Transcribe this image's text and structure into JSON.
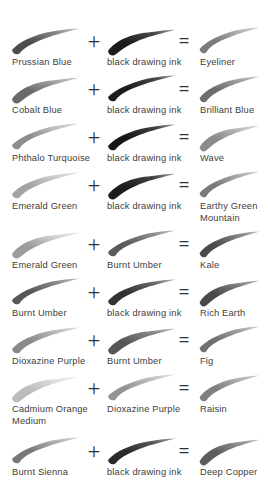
{
  "page": {
    "kind": "paint-mixing-swatch-chart",
    "background_color": "#ffffff",
    "text_color": "#3d3d3d",
    "plus_symbol": "+",
    "equals_symbol": "=",
    "column_count": 3
  },
  "rows": [
    {
      "a": {
        "label": "Prussian Blue",
        "color": "#4e4e4e",
        "tail_color": "#8d8d8d",
        "opacity": 1.0
      },
      "b": {
        "label": "black drawing ink",
        "color": "#1b1b1b",
        "tail_color": "#4a4a4a",
        "opacity": 1.0
      },
      "c": {
        "label": "Eyeliner",
        "color": "#7b7b7b",
        "tail_color": "#b6b6b6",
        "opacity": 1.0
      }
    },
    {
      "a": {
        "label": "Cobalt Blue",
        "color": "#6a6a6a",
        "tail_color": "#a9a9a9",
        "opacity": 1.0
      },
      "b": {
        "label": "black drawing ink",
        "color": "#1a1a1a",
        "tail_color": "#454545",
        "opacity": 1.0
      },
      "c": {
        "label": "Brilliant Blue",
        "color": "#6d6d6d",
        "tail_color": "#a3a3a3",
        "opacity": 1.0
      }
    },
    {
      "a": {
        "label": "Phthalo Turquoise",
        "color": "#8e8e8e",
        "tail_color": "#c4c4c4",
        "opacity": 1.0
      },
      "b": {
        "label": "black drawing ink",
        "color": "#161616",
        "tail_color": "#3f3f3f",
        "opacity": 1.0
      },
      "c": {
        "label": "Wave",
        "color": "#8b8b8b",
        "tail_color": "#bdbdbd",
        "opacity": 1.0
      }
    },
    {
      "a": {
        "label": "Emerald Green",
        "color": "#a4a4a4",
        "tail_color": "#d2d2d2",
        "opacity": 1.0
      },
      "b": {
        "label": "black drawing ink",
        "color": "#1d1d1d",
        "tail_color": "#464646",
        "opacity": 1.0
      },
      "c": {
        "label": "Earthy Green\nMountain",
        "color": "#7a7a7a",
        "tail_color": "#b0b0b0",
        "opacity": 1.0
      }
    },
    {
      "a": {
        "label": "Emerald Green",
        "color": "#9d9d9d",
        "tail_color": "#d6d6d6",
        "opacity": 1.0
      },
      "b": {
        "label": "Burnt Umber",
        "color": "#5a5a5a",
        "tail_color": "#8f8f8f",
        "opacity": 1.0
      },
      "c": {
        "label": "Kale",
        "color": "#4c4c4c",
        "tail_color": "#8a8a8a",
        "opacity": 1.0
      }
    },
    {
      "a": {
        "label": "Burnt Umber",
        "color": "#585858",
        "tail_color": "#8d8d8d",
        "opacity": 1.0
      },
      "b": {
        "label": "black drawing ink",
        "color": "#303030",
        "tail_color": "#6a6a6a",
        "opacity": 1.0
      },
      "c": {
        "label": "Rich Earth",
        "color": "#4a4a4a",
        "tail_color": "#858585",
        "opacity": 1.0
      }
    },
    {
      "a": {
        "label": "Dioxazine Purple",
        "color": "#8a8a8a",
        "tail_color": "#bfbfbf",
        "opacity": 1.0
      },
      "b": {
        "label": "Burnt Umber",
        "color": "#575757",
        "tail_color": "#8b8b8b",
        "opacity": 1.0
      },
      "c": {
        "label": "Fig",
        "color": "#6f6f6f",
        "tail_color": "#a5a5a5",
        "opacity": 1.0
      }
    },
    {
      "a": {
        "label": "Cadmium Orange\nMedium",
        "color": "#bcbcbc",
        "tail_color": "#e2e2e2",
        "opacity": 1.0
      },
      "b": {
        "label": "Dioxazine Purple",
        "color": "#949494",
        "tail_color": "#c6c6c6",
        "opacity": 1.0
      },
      "c": {
        "label": "Raisin",
        "color": "#7e7e7e",
        "tail_color": "#b3b3b3",
        "opacity": 1.0
      }
    },
    {
      "a": {
        "label": "Burnt Sienna",
        "color": "#787878",
        "tail_color": "#b5b5b5",
        "opacity": 1.0
      },
      "b": {
        "label": "black drawing ink",
        "color": "#2b2b2b",
        "tail_color": "#5c5c5c",
        "opacity": 1.0
      },
      "c": {
        "label": "Deep Copper",
        "color": "#5b5b5b",
        "tail_color": "#939393",
        "opacity": 1.0
      }
    }
  ],
  "layout": {
    "row_tops": [
      26,
      74,
      122,
      170,
      229,
      277,
      325,
      373,
      436
    ],
    "swatch_height": 30,
    "label_offset": 31
  }
}
